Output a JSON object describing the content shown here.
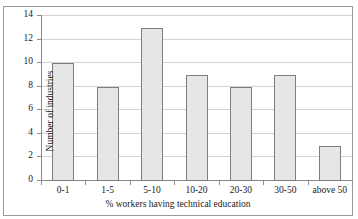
{
  "figure": {
    "page_text_remnant": "",
    "frame_border_color": "#9a9a9a",
    "background_color": "#ffffff"
  },
  "chart_data": {
    "type": "bar",
    "title": "",
    "categories": [
      "0-1",
      "1-5",
      "5-10",
      "10-20",
      "20-30",
      "30-50",
      "above 50"
    ],
    "values": [
      10,
      8,
      13,
      9,
      8,
      9,
      3
    ],
    "xlabel": "% workers having technical education",
    "ylabel": "Number of industries",
    "ylim": [
      0,
      14
    ],
    "ytick_values": [
      0,
      2,
      4,
      6,
      8,
      10,
      12,
      14
    ],
    "ytick_labels": [
      "0",
      "2",
      "4",
      "6",
      "8",
      "10",
      "12",
      "14"
    ],
    "grid": true,
    "grid_axis": "y",
    "grid_color": "#d3d3d3",
    "legend": false,
    "legend_position": "none",
    "bar_fill_color": "#e6e6e6",
    "bar_edge_color": "#7d7d7d",
    "axis_color": "#888888"
  }
}
